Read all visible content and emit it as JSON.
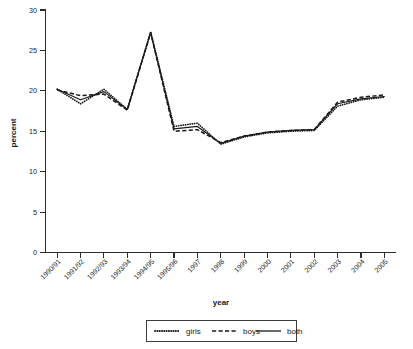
{
  "chart_data": {
    "type": "line",
    "title": "",
    "xlabel": "year",
    "ylabel": "percent",
    "grid": false,
    "legend_position": "bottom-center",
    "ylim": [
      0,
      30
    ],
    "yticks": [
      0,
      5,
      10,
      15,
      20,
      25,
      30
    ],
    "ytick_labels": [
      "0",
      "5",
      "10",
      "15",
      "20",
      "25",
      "30"
    ],
    "categories": [
      "1990/91",
      "1991/92",
      "1992/93",
      "1993/94",
      "1994/95",
      "1995/96",
      "1997",
      "1998",
      "1999",
      "2000",
      "2001",
      "2002",
      "2003",
      "2004",
      "2005"
    ],
    "series": [
      {
        "name": "girls",
        "style": "dotted",
        "values": [
          20.2,
          18.4,
          20.2,
          17.7,
          27.3,
          15.6,
          16.0,
          13.4,
          14.3,
          14.8,
          15.0,
          15.1,
          18.1,
          18.9,
          19.2
        ]
      },
      {
        "name": "boys",
        "style": "dashed",
        "values": [
          20.1,
          19.4,
          19.6,
          17.6,
          27.2,
          15.0,
          15.2,
          13.6,
          14.4,
          14.9,
          15.1,
          15.2,
          18.6,
          19.2,
          19.5
        ]
      },
      {
        "name": "both",
        "style": "solid",
        "values": [
          20.2,
          18.9,
          19.9,
          17.7,
          27.2,
          15.3,
          15.6,
          13.5,
          14.4,
          14.9,
          15.1,
          15.2,
          18.4,
          19.0,
          19.3
        ]
      }
    ]
  },
  "legend": {
    "items": [
      {
        "label": "girls",
        "style": "dotted"
      },
      {
        "label": "boys",
        "style": "dashed"
      },
      {
        "label": "both",
        "style": "solid"
      }
    ]
  },
  "colors": {
    "line": "#1a1a1a",
    "axis": "#2b2b2b",
    "background": "#ffffff"
  }
}
